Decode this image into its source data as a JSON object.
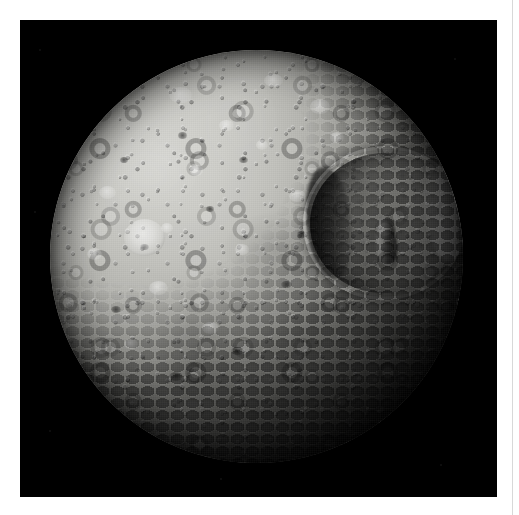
{
  "page": {
    "width": 519,
    "height": 515,
    "background_color": "#ffffff",
    "margin_left": 20,
    "margin_top": 20
  },
  "rule": {
    "name": "right-vertical-rule",
    "color": "#d8d8d8",
    "x": 512,
    "width": 1
  },
  "photo": {
    "subject": "Mimas",
    "kind": "grayscale-spacecraft-image",
    "background_color": "#000000",
    "plate": {
      "x": 20,
      "y": 20,
      "width": 477,
      "height": 477
    },
    "disk": {
      "center_x": 256,
      "center_y": 256,
      "diameter": 413,
      "illumination": "upper-left limb brightest, terminator sweeping in from lower-right",
      "surface_color_bright": "#d8d8d4",
      "surface_color_mid": "#999994",
      "surface_color_dark": "#3d3d3b",
      "shadow_color": "#000000"
    },
    "features": {
      "herschel_crater": {
        "name": "Herschel crater",
        "position": "right of centre, upper-middle",
        "rim_highlight": "#f2f2f0",
        "floor_shadow": "#1a1a1a",
        "central_peak": true
      },
      "bright_ray_crater": {
        "name": "bright ray crater",
        "position": "left of centre",
        "color": "#ffffff"
      },
      "terminator_crater_field": {
        "name": "shadowed crater field",
        "position": "lower-right quadrant and bottom limb",
        "description": "densely packed craters with long shadows"
      }
    }
  },
  "bright_spots": [
    {
      "left": "29%",
      "top": "9%",
      "w": "5.5%",
      "h": "4.0%"
    },
    {
      "left": "52%",
      "top": "6%",
      "w": "4.5%",
      "h": "3.2%"
    },
    {
      "left": "63%",
      "top": "12%",
      "w": "5.0%",
      "h": "3.6%"
    },
    {
      "left": "41%",
      "top": "17%",
      "w": "3.6%",
      "h": "2.8%"
    },
    {
      "left": "12%",
      "top": "33%",
      "w": "4.2%",
      "h": "3.2%"
    },
    {
      "left": "34%",
      "top": "28%",
      "w": "3.2%",
      "h": "2.6%"
    },
    {
      "left": "58%",
      "top": "34%",
      "w": "4.0%",
      "h": "3.0%"
    },
    {
      "left": "24%",
      "top": "56%",
      "w": "4.6%",
      "h": "3.4%"
    },
    {
      "left": "45%",
      "top": "47%",
      "w": "3.4%",
      "h": "2.8%"
    },
    {
      "left": "9%",
      "top": "48%",
      "w": "3.8%",
      "h": "3.0%"
    },
    {
      "left": "37%",
      "top": "66%",
      "w": "4.0%",
      "h": "2.8%"
    },
    {
      "left": "18%",
      "top": "70%",
      "w": "3.4%",
      "h": "2.6%"
    },
    {
      "left": "50%",
      "top": "22%",
      "w": "3.0%",
      "h": "2.4%"
    },
    {
      "left": "68%",
      "top": "20%",
      "w": "3.4%",
      "h": "2.6%"
    },
    {
      "left": "27%",
      "top": "42%",
      "w": "3.0%",
      "h": "2.4%"
    }
  ],
  "dark_spots": [
    {
      "left": "31%",
      "top": "20%",
      "w": "2.4%",
      "h": "1.6%"
    },
    {
      "left": "46%",
      "top": "26%",
      "w": "2.0%",
      "h": "1.4%"
    },
    {
      "left": "22%",
      "top": "47%",
      "w": "2.2%",
      "h": "1.5%"
    },
    {
      "left": "38%",
      "top": "38%",
      "w": "1.8%",
      "h": "1.3%"
    },
    {
      "left": "56%",
      "top": "56%",
      "w": "2.6%",
      "h": "1.8%"
    },
    {
      "left": "15%",
      "top": "62%",
      "w": "2.4%",
      "h": "1.7%"
    },
    {
      "left": "44%",
      "top": "72%",
      "w": "3.0%",
      "h": "2.0%"
    },
    {
      "left": "29%",
      "top": "78%",
      "w": "3.4%",
      "h": "2.2%"
    },
    {
      "left": "60%",
      "top": "44%",
      "w": "2.2%",
      "h": "1.6%"
    },
    {
      "left": "17%",
      "top": "26%",
      "w": "2.0%",
      "h": "1.4%"
    }
  ],
  "dust_specks": [
    {
      "left": "4%",
      "top": "6%",
      "size": "2px"
    },
    {
      "left": "3%",
      "top": "40%",
      "size": "2px"
    },
    {
      "left": "6%",
      "top": "86%",
      "size": "2px"
    },
    {
      "left": "91%",
      "top": "8%",
      "size": "2px"
    },
    {
      "left": "88%",
      "top": "93%",
      "size": "2px"
    },
    {
      "left": "42%",
      "top": "96%",
      "size": "2px"
    }
  ]
}
